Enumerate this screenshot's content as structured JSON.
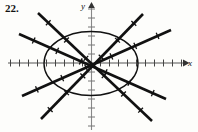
{
  "figure": {
    "exercise_number": "22.",
    "x_axis_label": "x",
    "y_axis_label": "y",
    "ink_color": "#111111",
    "axis_color": "#555555",
    "background": "#fdfdfb"
  },
  "chart_data": {
    "type": "scatter",
    "title": "",
    "subtitle": "",
    "xlabel": "x",
    "ylabel": "y",
    "grid": false,
    "legend": null,
    "axis": {
      "origin_px": [
        91,
        63
      ],
      "x_range_px": [
        8,
        186
      ],
      "y_range_px": [
        3,
        130
      ],
      "tick_spacing_px": 9,
      "x_tick_count_left": 9,
      "x_tick_count_right": 10,
      "y_tick_count_up": 6,
      "y_tick_count_down": 7,
      "x_arrow": true,
      "y_arrow": true,
      "tick_labels": []
    },
    "annotations": [
      "ellipse centered at origin",
      "four straight lines through the origin",
      "each line marked with short transverse hash marks"
    ],
    "ellipse": {
      "cx": 91,
      "cy": 63.5,
      "rx": 47,
      "ry": 32,
      "stroke_width": 1.4
    },
    "lines": [
      {
        "name": "line-shallow-up-right",
        "x1": 22,
        "y1": 96,
        "x2": 171,
        "y2": 30,
        "stroke_width": 2.6,
        "hash_positions": [
          0.1,
          0.27,
          0.43,
          0.6,
          0.76,
          0.91
        ]
      },
      {
        "name": "line-steep-up-right",
        "x1": 41,
        "y1": 119,
        "x2": 143,
        "y2": 14,
        "stroke_width": 2.6,
        "hash_positions": [
          0.09,
          0.25,
          0.41,
          0.59,
          0.75,
          0.91
        ]
      },
      {
        "name": "line-shallow-down-right",
        "x1": 19,
        "y1": 34,
        "x2": 166,
        "y2": 99,
        "stroke_width": 2.6,
        "hash_positions": [
          0.1,
          0.26,
          0.42,
          0.59,
          0.75,
          0.91
        ]
      },
      {
        "name": "line-steep-down-right",
        "x1": 38,
        "y1": 13,
        "x2": 152,
        "y2": 121,
        "stroke_width": 2.6,
        "hash_positions": [
          0.09,
          0.25,
          0.42,
          0.58,
          0.75,
          0.9
        ]
      }
    ]
  }
}
